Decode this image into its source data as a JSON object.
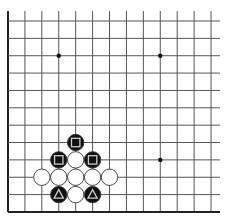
{
  "board": {
    "type": "go-diagram",
    "view": "lower-left corner, partial board",
    "columns": 13,
    "rows": 12,
    "origin_x": 8,
    "origin_y": 21,
    "spacing_x": 16.92,
    "spacing_y": 17.36,
    "line_top": 11,
    "line_right": 220,
    "line_color": "#555555",
    "edge_color": "#222222",
    "edges": [
      "left",
      "bottom"
    ],
    "star_points": [
      {
        "col": 3,
        "row": 2
      },
      {
        "col": 9,
        "row": 2
      },
      {
        "col": 9,
        "row": 8
      }
    ],
    "stones": [
      {
        "col": 4,
        "row": 7,
        "color": "black",
        "marker": "square"
      },
      {
        "col": 3,
        "row": 8,
        "color": "black",
        "marker": "square"
      },
      {
        "col": 4,
        "row": 8,
        "color": "white",
        "marker": ""
      },
      {
        "col": 5,
        "row": 8,
        "color": "black",
        "marker": "square"
      },
      {
        "col": 2,
        "row": 9,
        "color": "white",
        "marker": ""
      },
      {
        "col": 3,
        "row": 9,
        "color": "white",
        "marker": ""
      },
      {
        "col": 4,
        "row": 9,
        "color": "white",
        "marker": ""
      },
      {
        "col": 5,
        "row": 9,
        "color": "white",
        "marker": ""
      },
      {
        "col": 6,
        "row": 9,
        "color": "white",
        "marker": ""
      },
      {
        "col": 3,
        "row": 10,
        "color": "black",
        "marker": "triangle"
      },
      {
        "col": 4,
        "row": 10,
        "color": "white",
        "marker": ""
      },
      {
        "col": 5,
        "row": 10,
        "color": "black",
        "marker": "triangle"
      }
    ],
    "colors": {
      "black_stone": "#111111",
      "white_stone": "#ffffff",
      "stone_outline": "#333333",
      "marker_on_black": "#cccccc"
    }
  }
}
